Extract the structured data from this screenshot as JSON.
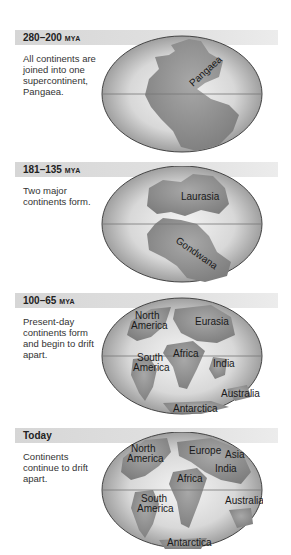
{
  "panels": [
    {
      "period": "280–200",
      "unit": "MYA",
      "description": "All continents are joined into one supercontinent, Pangaea.",
      "labels": [
        "Pangaea"
      ]
    },
    {
      "period": "181–135",
      "unit": "MYA",
      "description": "Two major continents form.",
      "labels": [
        "Laurasia",
        "Gondwana"
      ]
    },
    {
      "period": "100–65",
      "unit": "MYA",
      "description": "Present-day continents form and begin to drift apart.",
      "labels": [
        "North America",
        "Eurasia",
        "Africa",
        "South America",
        "India",
        "Australia",
        "Antarctica"
      ]
    },
    {
      "period": "Today",
      "unit": "",
      "description": "Continents continue to drift apart.",
      "labels": [
        "North America",
        "Europe",
        "Asia",
        "India",
        "Africa",
        "South America",
        "Australia",
        "Antarctica"
      ]
    }
  ],
  "colors": {
    "ocean_light": "#f2f2f2",
    "ocean_dark": "#9a9a9a",
    "land": "#8c8c8c",
    "header_bar": "#dcdcdc"
  }
}
